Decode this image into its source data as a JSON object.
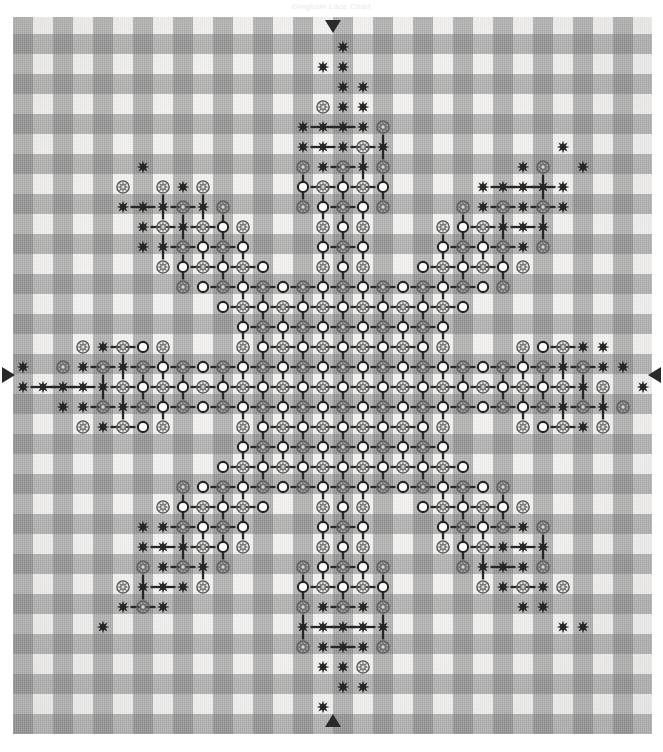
{
  "page": {
    "caption": "Gingham Lace Chart"
  },
  "fabric": {
    "name": "gingham-check",
    "cell_px": 20,
    "colors": {
      "light": "#f1f0ee",
      "medium": "#c6c4c1",
      "dark": "#9b9996"
    },
    "bounds": {
      "left": 13,
      "top": 17,
      "width": 639,
      "height": 717
    },
    "columns": 32,
    "rows": 36
  },
  "markers": {
    "top": {
      "label": "center-marker-top",
      "glyph": "▼",
      "direction": "down"
    },
    "bottom": {
      "label": "center-marker-bottom",
      "glyph": "▲",
      "direction": "up"
    },
    "left": {
      "label": "center-marker-left",
      "glyph": "◀",
      "direction": "left"
    },
    "right": {
      "label": "center-marker-right",
      "glyph": "▶",
      "direction": "right"
    }
  },
  "legend": {
    "symbols": [
      {
        "key": "dark-star",
        "name": "double-cross-star",
        "color": "#2b2b2b",
        "shape": "8-point star"
      },
      {
        "key": "gray-star",
        "name": "woven-circle-star",
        "color": "#6d6d6d",
        "shape": "8-point star on open circle"
      },
      {
        "key": "open-circle",
        "name": "woven-circle",
        "color": "#ffffff",
        "outline": "#262626",
        "shape": "circle"
      },
      {
        "key": "h-dash",
        "name": "running-stitch-horizontal",
        "color": "#2b2b2b",
        "shape": "dash"
      },
      {
        "key": "v-bar",
        "name": "running-stitch-vertical",
        "color": "#2b2b2b",
        "shape": "bar"
      }
    ]
  },
  "chart_data": {
    "type": "heatmap",
    "xlabel": "",
    "ylabel": "",
    "grid": true,
    "legend_position": "none",
    "cell_size": 20,
    "cols": 32,
    "rows": 36,
    "center_col": 16,
    "center_row": 18,
    "motif": "eight-point star medallion with radiating diamond rays",
    "symbol_codes": {
      "0": "empty",
      "1": "open-circle",
      "2": "dark-star",
      "3": "gray-star"
    },
    "note": "Symbol field is generated radially from the motif description; rings of the eight-point star medallion are listed below as radius bands.",
    "radial_bands": [
      {
        "r_min": 0,
        "r_max": 3,
        "fill": "dense",
        "dominant": "open-circle"
      },
      {
        "r_min": 3,
        "r_max": 6,
        "fill": "dense",
        "dominant": "gray-star"
      },
      {
        "r_min": 6,
        "r_max": 9,
        "fill": "dense",
        "dominant": "open-circle"
      },
      {
        "r_min": 9,
        "r_max": 12,
        "fill": "rayed",
        "dominant": "gray-star"
      },
      {
        "r_min": 12,
        "r_max": 15,
        "fill": "rayed",
        "dominant": "dark-star"
      },
      {
        "r_min": 15,
        "r_max": 18,
        "fill": "sparse",
        "dominant": "dark-star"
      }
    ],
    "ray_angles_deg": [
      0,
      45,
      90,
      135,
      180,
      225,
      270,
      315
    ],
    "values": []
  }
}
